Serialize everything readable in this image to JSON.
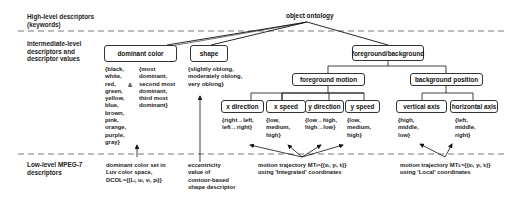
{
  "levels": {
    "high": "High-level descriptors\n(keywords)",
    "intermediate": "Intermediate-level\ndescriptors and\ndescriptor values",
    "low": "Low-level MPEG-7\ndescriptors"
  },
  "root": "object ontology",
  "nodes": {
    "dominant_color": "dominant color",
    "shape": "shape",
    "foreground_background": "foreground/background",
    "foreground_motion": "foreground motion",
    "background_position": "background position",
    "x_direction": "x direction",
    "x_speed": "x speed",
    "y_direction": "y direction",
    "y_speed": "y speed",
    "vertical_axis": "vertical axis",
    "horizontal_axis": "horizontal axis"
  },
  "values": {
    "colors": "{black,\nwhite,\nred,\ngreen,\nyellow,\nblue,\nbrown,\npink,\norange,\npurple,\ngray}",
    "ampersand": "&",
    "dominance": "{most\ndominant,\nsecond most\ndominant,\nthird most\ndominant}",
    "shape": "{slightly oblong,\nmoderately oblong,\nvery oblong}",
    "x_direction": "{right→left,\nleft→right}",
    "x_speed": "{low,\nmedium,\nhigh}",
    "y_direction": "{low→high,\nhigh→low}",
    "y_speed": "{low,\nmedium,\nhigh}",
    "vertical_axis": "{high,\nmiddle,\nlow}",
    "horizontal_axis": "{left,\nmiddle,\nright}"
  },
  "low_level": {
    "dcol": "dominant color set in\nLuv color space,\nDCOL={(Lᵢ, uᵢ, vᵢ, pᵢ)}",
    "shape": "eccentricity\nvalue of\ncontour-based\nshape descriptor",
    "mt_integrated": "motion trajectory MTᵢ={(xᵢ, yᵢ, tᵢ)}\nusing 'Integrated' coordinates",
    "mt_local": "motion trajectory MTʟ={(xᵢ, yᵢ, tᵢ)}\nusing 'Local' coordinates"
  }
}
